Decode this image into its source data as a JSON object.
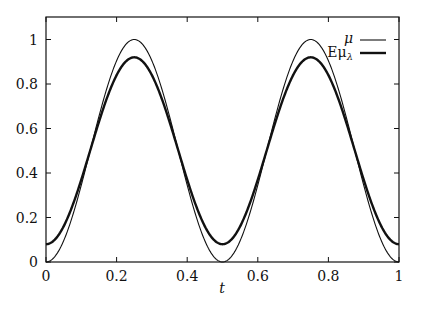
{
  "chart_data": {
    "type": "line",
    "title": "",
    "xlabel": "t",
    "ylabel": "",
    "xlim": [
      0,
      1
    ],
    "ylim": [
      0,
      1.08
    ],
    "grid": false,
    "legend_position": "upper right",
    "x_ticks": [
      "0",
      "0.2",
      "0.4",
      "0.6",
      "0.8",
      "1"
    ],
    "y_ticks": [
      "0",
      "0.2",
      "0.4",
      "0.6",
      "0.8",
      "1"
    ],
    "x": [
      0,
      0.05,
      0.1,
      0.15,
      0.2,
      0.25,
      0.3,
      0.35,
      0.4,
      0.45,
      0.5,
      0.55,
      0.6,
      0.65,
      0.7,
      0.75,
      0.8,
      0.85,
      0.9,
      0.95,
      1
    ],
    "series": [
      {
        "name": "μ",
        "style": "thin",
        "values": [
          0,
          0.095,
          0.345,
          0.655,
          0.905,
          1.0,
          0.905,
          0.655,
          0.345,
          0.095,
          0,
          0.095,
          0.345,
          0.655,
          0.905,
          1.0,
          0.905,
          0.655,
          0.345,
          0.095,
          0
        ]
      },
      {
        "name": "Eμλ",
        "style": "thick",
        "values": [
          0.08,
          0.16,
          0.37,
          0.63,
          0.84,
          0.92,
          0.84,
          0.63,
          0.37,
          0.16,
          0.08,
          0.16,
          0.37,
          0.63,
          0.84,
          0.92,
          0.84,
          0.63,
          0.37,
          0.16,
          0.08
        ]
      }
    ]
  },
  "legend": {
    "mu_label": "μ",
    "emu_label_prefix": "Eμ",
    "emu_label_sub": "λ"
  },
  "axes": {
    "xlabel": "t",
    "x_ticks": [
      "0",
      "0.2",
      "0.4",
      "0.6",
      "0.8",
      "1"
    ],
    "y_ticks": [
      "0",
      "0.2",
      "0.4",
      "0.6",
      "0.8",
      "1"
    ]
  }
}
